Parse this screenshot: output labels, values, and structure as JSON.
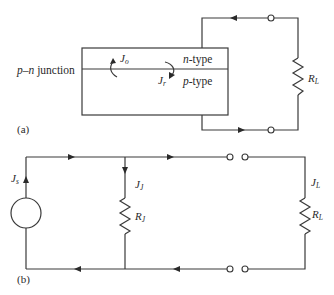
{
  "figure": {
    "part_a": {
      "panel_label": "(a)",
      "junction_label": {
        "prefix": "p",
        "dash": "–",
        "n": "n",
        "suffix": " junction"
      },
      "n_region": {
        "letter": "n",
        "suffix": "-type"
      },
      "p_region": {
        "letter": "p",
        "suffix": "-type"
      },
      "current_o": {
        "symbol": "J",
        "subscript": "o"
      },
      "current_r": {
        "symbol": "J",
        "subscript": "r"
      },
      "load_resistor": {
        "symbol": "R",
        "subscript": "L"
      }
    },
    "part_b": {
      "panel_label": "(b)",
      "source_current": {
        "symbol": "J",
        "subscript": "s"
      },
      "junction_current": {
        "symbol": "J",
        "subscript": "J"
      },
      "junction_resistor": {
        "symbol": "R",
        "subscript": "J"
      },
      "load_current": {
        "symbol": "J",
        "subscript": "L"
      },
      "load_resistor": {
        "symbol": "R",
        "subscript": "L"
      }
    },
    "colors": {
      "line": "#3a3a3a",
      "text": "#2a2a2a",
      "background": "#ffffff"
    }
  }
}
